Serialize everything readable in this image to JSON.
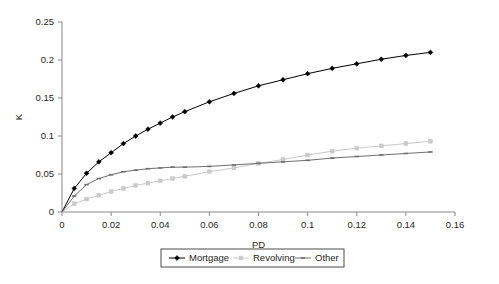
{
  "chart_data": {
    "type": "line",
    "title": "",
    "xlabel": "PD",
    "ylabel": "K",
    "xlim": [
      0,
      0.16
    ],
    "ylim": [
      0,
      0.25
    ],
    "xticks": [
      "0",
      "0.02",
      "0.04",
      "0.06",
      "0.08",
      "0.1",
      "0.12",
      "0.14",
      "0.16"
    ],
    "xtick_values": [
      0,
      0.02,
      0.04,
      0.06,
      0.08,
      0.1,
      0.12,
      0.14,
      0.16
    ],
    "yticks": [
      "0",
      "0.05",
      "0.1",
      "0.15",
      "0.2",
      "0.25"
    ],
    "ytick_values": [
      0,
      0.05,
      0.1,
      0.15,
      0.2,
      0.25
    ],
    "grid": false,
    "legend_position": "bottom-center",
    "x": [
      0,
      0.005,
      0.01,
      0.015,
      0.02,
      0.025,
      0.03,
      0.035,
      0.04,
      0.045,
      0.05,
      0.06,
      0.07,
      0.08,
      0.09,
      0.1,
      0.11,
      0.12,
      0.13,
      0.14,
      0.15
    ],
    "series": [
      {
        "name": "Mortgage",
        "color": "#000000",
        "marker": "diamond",
        "values": [
          0,
          0.031,
          0.051,
          0.066,
          0.078,
          0.09,
          0.1,
          0.109,
          0.117,
          0.125,
          0.132,
          0.145,
          0.156,
          0.166,
          0.174,
          0.182,
          0.189,
          0.195,
          0.201,
          0.206,
          0.21
        ]
      },
      {
        "name": "Revolving",
        "color": "#c9c9c9",
        "marker": "square",
        "values": [
          0,
          0.011,
          0.017,
          0.022,
          0.027,
          0.031,
          0.035,
          0.038,
          0.041,
          0.044,
          0.047,
          0.053,
          0.058,
          0.064,
          0.069,
          0.075,
          0.08,
          0.084,
          0.087,
          0.09,
          0.093
        ]
      },
      {
        "name": "Other",
        "color": "#6e6e6e",
        "marker": "dash",
        "values": [
          0,
          0.021,
          0.036,
          0.044,
          0.049,
          0.053,
          0.055,
          0.057,
          0.058,
          0.059,
          0.059,
          0.06,
          0.062,
          0.064,
          0.066,
          0.068,
          0.071,
          0.073,
          0.075,
          0.077,
          0.079
        ]
      }
    ]
  },
  "axes": {
    "y_axis_title": "K",
    "x_axis_title": "PD"
  },
  "legend": {
    "items": [
      {
        "label": "Mortgage"
      },
      {
        "label": "Revolving"
      },
      {
        "label": "Other"
      }
    ]
  }
}
